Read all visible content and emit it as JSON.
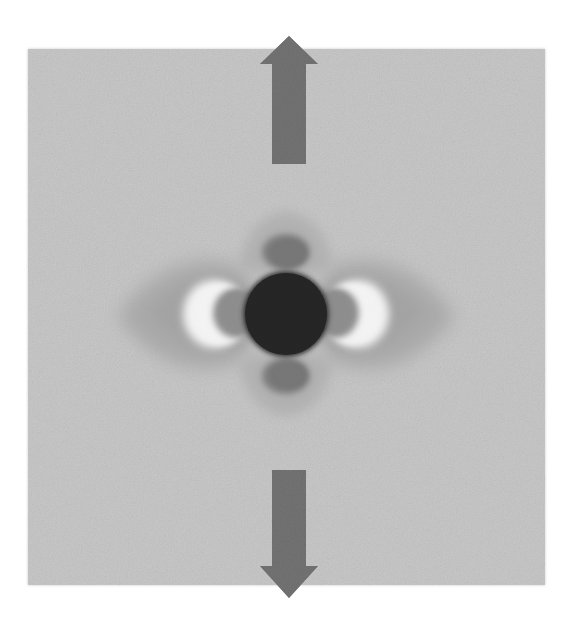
{
  "figure": {
    "type": "grayscale-field-visualization",
    "canvas": {
      "width": 565,
      "height": 632,
      "background_color": "#ffffff"
    },
    "field_panel": {
      "name": "noisy-gray-field",
      "x": 28,
      "y": 49,
      "width": 517,
      "height": 536,
      "base_color": "#c9c9c9",
      "noise": {
        "enabled": true,
        "amplitude": 0.055,
        "grain": "fine"
      }
    },
    "center": {
      "x": 286,
      "y": 314
    },
    "core": {
      "label": "central-dark-sphere",
      "cx": 286,
      "cy": 314,
      "rx": 43,
      "ry": 43,
      "color": "#070707",
      "edge_softness": 3
    },
    "lobes": [
      {
        "label": "left-lobe",
        "orientation": "west",
        "wing": {
          "color": "#a0a0a0",
          "extent": 115,
          "height": 95
        },
        "bright_crescent": {
          "color": "#fbfbfb",
          "cx": 212,
          "cy": 314,
          "rx": 30,
          "ry": 33
        },
        "dark_blob": {
          "color": "#868686",
          "cx": 233,
          "cy": 313,
          "rx": 22,
          "ry": 24
        }
      },
      {
        "label": "right-lobe",
        "orientation": "east",
        "wing": {
          "color": "#a0a0a0",
          "extent": 115,
          "height": 95
        },
        "bright_crescent": {
          "color": "#fbfbfb",
          "cx": 360,
          "cy": 314,
          "rx": 30,
          "ry": 33
        },
        "dark_blob": {
          "color": "#868686",
          "cx": 339,
          "cy": 313,
          "rx": 22,
          "ry": 24
        }
      },
      {
        "label": "top-lobe",
        "orientation": "north",
        "wing": {
          "color": "#aaaaaa",
          "extent": 60,
          "height": 62
        },
        "dark_blob": {
          "color": "#6f6f6f",
          "cx": 286,
          "cy": 252,
          "rx": 22,
          "ry": 17
        }
      },
      {
        "label": "bottom-lobe",
        "orientation": "south",
        "wing": {
          "color": "#aaaaaa",
          "extent": 60,
          "height": 62
        },
        "dark_blob": {
          "color": "#6f6f6f",
          "cx": 286,
          "cy": 376,
          "rx": 22,
          "ry": 17
        }
      }
    ],
    "arrows": [
      {
        "label": "up-arrow",
        "direction": "up",
        "color": "#737373",
        "tip_x": 289,
        "tip_y": 36,
        "tail_y": 164,
        "shaft_half_width": 17,
        "head_half_width": 29,
        "head_base_y": 64
      },
      {
        "label": "down-arrow",
        "direction": "down",
        "color": "#737373",
        "tip_x": 289,
        "tip_y": 598,
        "tail_y": 470,
        "shaft_half_width": 17,
        "head_half_width": 29,
        "head_base_y": 566
      }
    ],
    "palette": {
      "background": "#ffffff",
      "field": "#c9c9c9",
      "core": "#070707",
      "arrow": "#737373",
      "highlight": "#fbfbfb",
      "mid_gray": "#a0a0a0",
      "dark_gray": "#6f6f6f"
    },
    "labels": [],
    "annotations": []
  }
}
